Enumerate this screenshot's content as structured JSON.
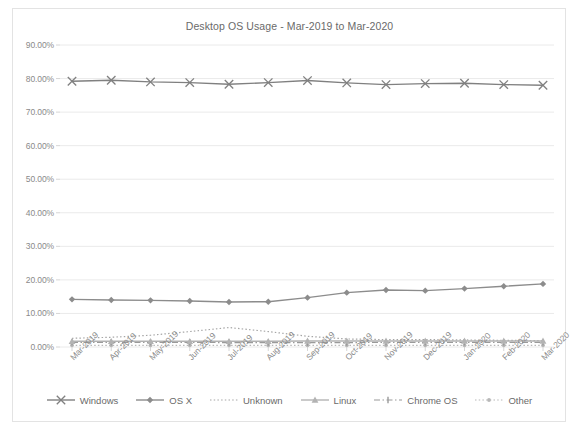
{
  "chart_data": {
    "type": "line",
    "title": "Desktop OS Usage - Mar-2019 to Mar-2020",
    "xlabel": "",
    "ylabel": "",
    "ylim": [
      0,
      90
    ],
    "grid": true,
    "legend_position": "bottom",
    "categories": [
      "Mar-2019",
      "Apr-2019",
      "May-2019",
      "Jun-2019",
      "Jul-2019",
      "Aug-2019",
      "Sep-2019",
      "Oct-2019",
      "Nov-2019",
      "Dec-2019",
      "Jan-2020",
      "Feb-2020",
      "Mar-2020"
    ],
    "ytick_labels": [
      "90.00%",
      "80.00%",
      "70.00%",
      "60.00%",
      "50.00%",
      "40.00%",
      "30.00%",
      "20.00%",
      "10.00%",
      "0.00%"
    ],
    "ytick_values": [
      90,
      80,
      70,
      60,
      50,
      40,
      30,
      20,
      10,
      0
    ],
    "series": [
      {
        "name": "Windows",
        "marker": "x-cross",
        "dash": "solid",
        "color": "#808080",
        "values": [
          79.2,
          79.5,
          79.0,
          78.8,
          78.3,
          78.8,
          79.4,
          78.7,
          78.2,
          78.5,
          78.6,
          78.2,
          78.0
        ]
      },
      {
        "name": "OS X",
        "marker": "diamond",
        "dash": "solid",
        "color": "#8c8c8c",
        "values": [
          14.2,
          14.0,
          13.9,
          13.7,
          13.4,
          13.5,
          14.7,
          16.2,
          17.0,
          16.8,
          17.4,
          18.1,
          18.8
        ]
      },
      {
        "name": "Unknown",
        "marker": "none",
        "dash": "dotted",
        "color": "#a6a6a6",
        "values": [
          2.6,
          2.9,
          3.5,
          4.6,
          5.8,
          4.6,
          3.2,
          2.4,
          2.2,
          2.2,
          2.1,
          2.0,
          1.9
        ]
      },
      {
        "name": "Linux",
        "marker": "triangle",
        "dash": "solid",
        "color": "#b3b3b3",
        "values": [
          1.7,
          1.7,
          1.7,
          1.7,
          1.7,
          1.7,
          1.8,
          1.8,
          1.8,
          1.8,
          1.8,
          1.8,
          1.8
        ]
      },
      {
        "name": "Chrome OS",
        "marker": "dash",
        "dash": "dash-dot",
        "color": "#9a9a9a",
        "values": [
          1.4,
          1.4,
          1.4,
          1.4,
          1.3,
          1.3,
          1.3,
          1.3,
          1.4,
          1.4,
          1.4,
          1.4,
          1.4
        ]
      },
      {
        "name": "Other",
        "marker": "dot",
        "dash": "dotted",
        "color": "#b8b8b8",
        "values": [
          0.5,
          0.5,
          0.5,
          0.5,
          0.5,
          0.5,
          0.5,
          0.5,
          0.5,
          0.5,
          0.5,
          0.5,
          0.5
        ]
      }
    ]
  }
}
